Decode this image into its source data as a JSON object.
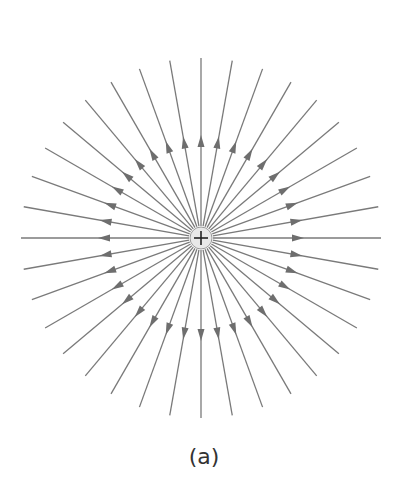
{
  "figure": {
    "caption": "(a)",
    "charge": {
      "sign": "+",
      "cx": 201,
      "cy": 238,
      "radius": 11
    },
    "field_lines": {
      "count": 36,
      "inner_radius": 12,
      "outer_radius": 180,
      "arrow_radius": 97,
      "direction": "outward",
      "line_color": "#7a7a7a"
    }
  }
}
